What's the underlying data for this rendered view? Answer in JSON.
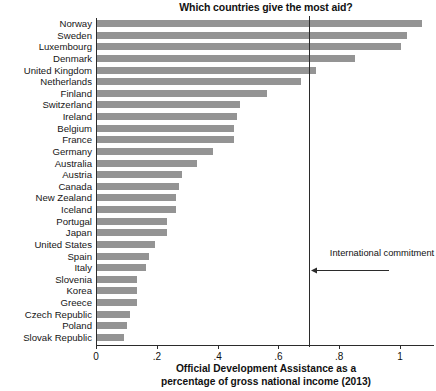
{
  "chart_data": {
    "type": "bar",
    "orientation": "horizontal",
    "title": "Which countries give the most aid?",
    "xlabel_line1": "Official Development Assistance as a",
    "xlabel_line2": "percentage of gross national income (2013)",
    "ylabel": "",
    "xlim": [
      0,
      1.12
    ],
    "xticks": [
      0,
      0.2,
      0.4,
      0.6,
      0.8,
      1
    ],
    "xticklabels": [
      "0",
      ".2",
      ".4",
      ".6",
      ".8",
      "1"
    ],
    "grid": false,
    "legend": false,
    "bar_color": "#949494",
    "axis_color": "#2b2b2b",
    "reference_line": {
      "value": 0.7,
      "label": "International commitment",
      "color": "#2b2b2b"
    },
    "categories": [
      "Norway",
      "Sweden",
      "Luxembourg",
      "Denmark",
      "United Kingdom",
      "Netherlands",
      "Finland",
      "Switzerland",
      "Ireland",
      "Belgium",
      "France",
      "Germany",
      "Australia",
      "Austria",
      "Canada",
      "New Zealand",
      "Iceland",
      "Portugal",
      "Japan",
      "United States",
      "Spain",
      "Italy",
      "Slovenia",
      "Korea",
      "Greece",
      "Czech Republic",
      "Poland",
      "Slovak Republic"
    ],
    "values": [
      1.07,
      1.02,
      1.0,
      0.85,
      0.72,
      0.67,
      0.56,
      0.47,
      0.46,
      0.45,
      0.45,
      0.38,
      0.33,
      0.28,
      0.27,
      0.26,
      0.26,
      0.23,
      0.23,
      0.19,
      0.17,
      0.16,
      0.13,
      0.13,
      0.13,
      0.11,
      0.1,
      0.09
    ]
  }
}
